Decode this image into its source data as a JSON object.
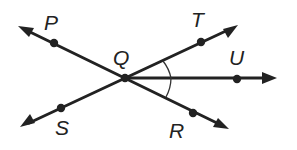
{
  "diagram": {
    "title": "",
    "vertex": {
      "label": "Q",
      "x": 125,
      "y": 78
    },
    "lines": [
      {
        "name": "line-PR",
        "from": "P",
        "to": "R"
      },
      {
        "name": "line-ST",
        "from": "S",
        "to": "T"
      }
    ],
    "ray": {
      "name": "ray-QU",
      "from": "Q",
      "through": "U"
    },
    "points": [
      {
        "label": "P",
        "x": 54,
        "y": 43
      },
      {
        "label": "Q",
        "x": 125,
        "y": 78
      },
      {
        "label": "T",
        "x": 201,
        "y": 42
      },
      {
        "label": "U",
        "x": 237,
        "y": 79
      },
      {
        "label": "S",
        "x": 61,
        "y": 108
      },
      {
        "label": "R",
        "x": 193,
        "y": 113
      }
    ],
    "angle_marks": [
      {
        "name": "angle-TQU",
        "arms": [
          "T",
          "U"
        ],
        "marks": 1
      },
      {
        "name": "angle-UQR",
        "arms": [
          "U",
          "R"
        ],
        "marks": 1
      }
    ],
    "labels": {
      "P": "P",
      "Q": "Q",
      "T": "T",
      "U": "U",
      "S": "S",
      "R": "R"
    }
  }
}
